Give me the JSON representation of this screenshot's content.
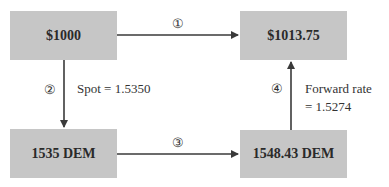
{
  "diagram": {
    "boxes": [
      {
        "id": "usd-start",
        "label": "$1000"
      },
      {
        "id": "usd-end",
        "label": "$1013.75"
      },
      {
        "id": "dem-spot",
        "label": "1535 DEM"
      },
      {
        "id": "dem-invested",
        "label": "1548.43 DEM"
      }
    ],
    "steps": [
      {
        "number": "①",
        "from": "$1000",
        "to": "$1013.75"
      },
      {
        "number": "②",
        "from": "$1000",
        "to": "1535 DEM",
        "note": "Spot = 1.5350"
      },
      {
        "number": "③",
        "from": "1535 DEM",
        "to": "1548.43 DEM"
      },
      {
        "number": "④",
        "from": "1548.43 DEM",
        "to": "$1013.75",
        "note_line1": "Forward rate",
        "note_line2": "= 1.5274"
      }
    ],
    "colors": {
      "box_fill": "#c6c6c6",
      "line": "#3a3a3a",
      "text": "#2a2a2a"
    }
  }
}
